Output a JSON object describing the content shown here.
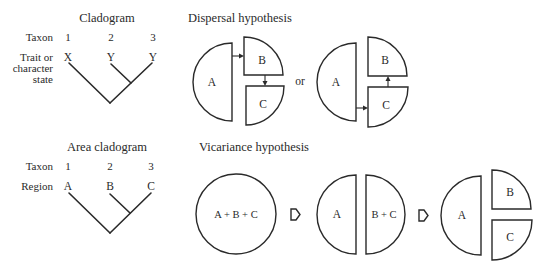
{
  "cladogram": {
    "title": "Cladogram",
    "row_labels": {
      "taxon": "Taxon",
      "trait_line1": "Trait or",
      "trait_line2": "character",
      "trait_line3": "state"
    },
    "taxa": [
      "1",
      "2",
      "3"
    ],
    "states": [
      "X",
      "Y",
      "Y"
    ]
  },
  "area_cladogram": {
    "title": "Area cladogram",
    "row_labels": {
      "taxon": "Taxon",
      "region": "Region"
    },
    "taxa": [
      "1",
      "2",
      "3"
    ],
    "regions": [
      "A",
      "B",
      "C"
    ]
  },
  "dispersal": {
    "title": "Dispersal hypothesis",
    "separator": "or",
    "option1": {
      "half": "A",
      "top_quarter": "B",
      "bottom_quarter": "C",
      "arrows": [
        "A → B",
        "B → C"
      ]
    },
    "option2": {
      "half": "A",
      "top_quarter": "B",
      "bottom_quarter": "C",
      "arrows": [
        "A → C",
        "C → B"
      ]
    }
  },
  "vicariance": {
    "title": "Vicariance hypothesis",
    "stage1": {
      "circle": "A + B + C"
    },
    "stage2": {
      "left_half": "A",
      "right_half": "B + C"
    },
    "stage3": {
      "half": "A",
      "top_quarter": "B",
      "bottom_quarter": "C"
    },
    "transition_icon": "open-right-arrow-icon"
  },
  "colors": {
    "ink": "#2a2a2a",
    "background": "#ffffff"
  }
}
